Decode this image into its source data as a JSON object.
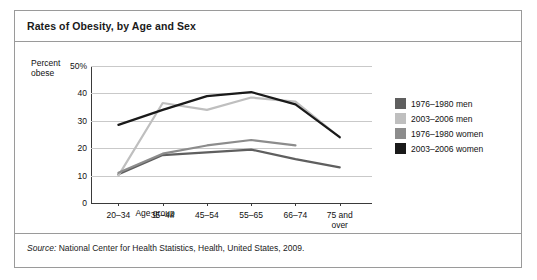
{
  "title": "Rates of Obesity, by Age and Sex",
  "source": {
    "label": "Source:",
    "text": " National Center for Health Statistics, Health, United States, 2009."
  },
  "axis": {
    "y_label_line1": "Percent",
    "y_label_line2": "obese",
    "x_title": "Age group"
  },
  "legend": [
    {
      "label": "1976–1980 men",
      "color": "#5f5f5f"
    },
    {
      "label": "2003–2006 men",
      "color": "#bfbfbf"
    },
    {
      "label": "1976–1980 women",
      "color": "#8c8c8c"
    },
    {
      "label": "2003–2006 women",
      "color": "#1a1a1a"
    }
  ],
  "chart_data": {
    "type": "line",
    "title": "Rates of Obesity, by Age and Sex",
    "xlabel": "Age group",
    "ylabel": "Percent obese",
    "categories": [
      "20–34",
      "35–44",
      "45–54",
      "55–65",
      "66–74",
      "75 and over"
    ],
    "ylim": [
      0,
      50
    ],
    "yticks": [
      0,
      10,
      20,
      30,
      40,
      50
    ],
    "ytick_labels": [
      "0",
      "10",
      "20",
      "30",
      "40",
      "50%"
    ],
    "grid": true,
    "legend_position": "right",
    "series": [
      {
        "name": "1976–1980 men",
        "color": "#5f5f5f",
        "values": [
          10.5,
          17.5,
          18.5,
          19.5,
          16.0,
          13.0
        ]
      },
      {
        "name": "2003–2006 men",
        "color": "#bfbfbf",
        "values": [
          10.0,
          36.5,
          34.0,
          38.5,
          37.0,
          24.0
        ]
      },
      {
        "name": "1976–1980 women",
        "color": "#8c8c8c",
        "values": [
          11.0,
          18.0,
          21.0,
          23.0,
          21.0,
          null
        ]
      },
      {
        "name": "2003–2006 women",
        "color": "#1a1a1a",
        "values": [
          28.5,
          34.0,
          39.0,
          40.5,
          36.0,
          24.0
        ]
      }
    ]
  }
}
